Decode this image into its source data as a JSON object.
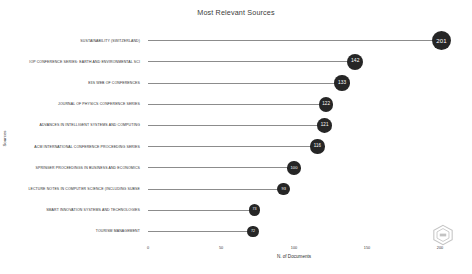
{
  "chart_data": {
    "type": "bar",
    "title": "Most Relevant Sources",
    "xlabel": "N. of Documents",
    "ylabel": "Sources",
    "xlim": [
      0,
      200
    ],
    "xticks": [
      0,
      50,
      100,
      150,
      200
    ],
    "grid": false,
    "legend": null,
    "categories": [
      "SUSTAINABILITY (SWITZERLAND)",
      "IOP CONFERENCE SERIES: EARTH AND ENVIRONMENTAL SCI",
      "E3S WEB OF CONFERENCES",
      "JOURNAL OF PHYSICS CONFERENCE SERIES",
      "ADVANCES IN INTELLIGENT SYSTEMS AND COMPUTING",
      "ACM INTERNATIONAL CONFERENCE PROCEEDING SERIES",
      "SPRINGER PROCEEDINGS IN BUSINESS AND ECONOMICS",
      "LECTURE NOTES IN COMPUTER SCIENCE (INCLUDING SUBSE",
      "SMART INNOVATION SYSTEMS AND TECHNOLOGIES",
      "TOURISM MANAGEMENT"
    ],
    "values": [
      201,
      142,
      133,
      122,
      121,
      116,
      100,
      93,
      73,
      72
    ],
    "marker_color": "#262626",
    "stem_color": "#8c8c8c"
  },
  "watermark": {
    "icon": "logo-badge-icon"
  }
}
